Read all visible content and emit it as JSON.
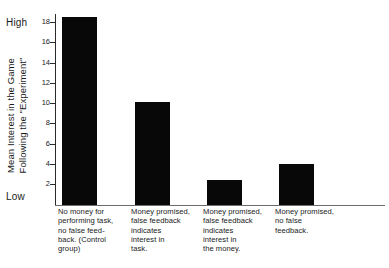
{
  "chart_data": {
    "type": "bar",
    "title": "",
    "xlabel": "",
    "ylabel_lines": [
      "Mean Interest in the Game",
      "Following the \"Experiment\""
    ],
    "ylabel": "Mean Interest in the Game Following the \"Experiment\"",
    "ylim": [
      0,
      19.2
    ],
    "yticks": [
      2,
      4,
      6,
      8,
      10,
      12,
      14,
      16,
      18
    ],
    "ytick_labels": [
      "2",
      "4",
      "6",
      "8",
      "10",
      "12",
      "14",
      "16",
      "18"
    ],
    "axis_endcap_high": "High",
    "axis_endcap_low": "Low",
    "grid": false,
    "legend": null,
    "bar_color": "#080808",
    "categories": [
      [
        "No money for",
        "performing task,",
        "no false feed-",
        "back. (Control",
        "group)"
      ],
      [
        "Money promised,",
        "false feedback",
        "indicates",
        "interest in",
        "task."
      ],
      [
        "Money promised,",
        "false feedback",
        "indicates",
        "interest in",
        "the money."
      ],
      [
        "Money promised,",
        "no false",
        "feedback."
      ]
    ],
    "category_names": [
      "No money for performing task, no false feedback. (Control group)",
      "Money promised, false feedback indicates interest in task.",
      "Money promised, false feedback indicates interest in the money.",
      "Money promised, no false feedback."
    ],
    "values": [
      18.5,
      10.2,
      2.5,
      4.0
    ]
  }
}
